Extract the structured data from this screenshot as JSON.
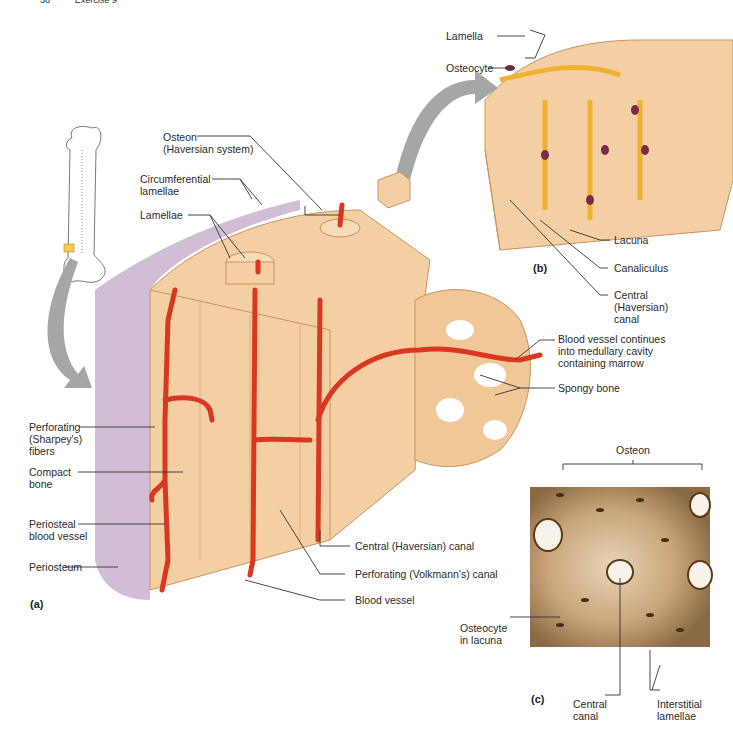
{
  "header": {
    "page_number": "38",
    "exercise": "Exercise 9"
  },
  "panels": {
    "a": "(a)",
    "b": "(b)",
    "c": "(c)"
  },
  "labels_a": {
    "osteon": "Osteon\n(Haversian system)",
    "circumferential_lamellae": "Circumferential\nlamellae",
    "lamellae": "Lamellae",
    "perforating_fibers": "Perforating\n(Sharpey's)\nfibers",
    "compact_bone": "Compact\nbone",
    "periosteal_blood_vessel": "Periosteal\nblood vessel",
    "periosteum": "Periosteum",
    "central_canal": "Central (Haversian) canal",
    "perforating_canal": "Perforating (Volkmann's) canal",
    "blood_vessel": "Blood vessel",
    "blood_vessel_continues": "Blood vessel continues\ninto medullary cavity\ncontaining marrow",
    "spongy_bone": "Spongy bone"
  },
  "labels_b": {
    "lamella": "Lamella",
    "osteocyte": "Osteocyte",
    "lacuna": "Lacuna",
    "canaliculus": "Canaliculus",
    "central_canal": "Central\n(Haversian)\ncanal"
  },
  "labels_c": {
    "osteon": "Osteon",
    "osteocyte_in_lacuna": "Osteocyte\nin lacuna",
    "central_canal": "Central\ncanal",
    "interstitial_lamellae": "Interstitial\nlamellae"
  },
  "colors": {
    "bone": "#f3cfa3",
    "bone_dark": "#e2b07c",
    "vessel": "#d9371f",
    "periosteum": "#c9b3cf",
    "arrow": "#a4a6a8",
    "osteocyte": "#f0b030",
    "nucleus": "#7a2a4a",
    "micrograph": "#c8a57a"
  }
}
